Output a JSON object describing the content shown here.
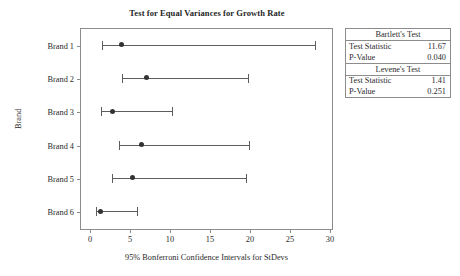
{
  "chart_data": {
    "type": "scatter",
    "title": "Test for Equal Variances for Growth Rate",
    "xlabel": "95% Bonferroni Confidence Intervals for StDevs",
    "ylabel": "Brand",
    "xlim": [
      0,
      30
    ],
    "xticks": [
      0,
      5,
      10,
      15,
      20,
      25,
      30
    ],
    "xticklabels": [
      "0",
      "5",
      "10",
      "15",
      "20",
      "25",
      "30"
    ],
    "categories": [
      "Brand 1",
      "Brand 2",
      "Brand 3",
      "Brand 4",
      "Brand 5",
      "Brand 6"
    ],
    "grid": false,
    "legend": false,
    "series": [
      {
        "name": "95% Bonferroni CI for StDev",
        "points": [
          {
            "category": "Brand 1",
            "center": 3.9,
            "lower": 1.5,
            "upper": 28.1
          },
          {
            "category": "Brand 2",
            "center": 7.0,
            "lower": 4.0,
            "upper": 19.8
          },
          {
            "category": "Brand 3",
            "center": 2.8,
            "lower": 1.4,
            "upper": 10.3
          },
          {
            "category": "Brand 4",
            "center": 6.4,
            "lower": 3.6,
            "upper": 19.9
          },
          {
            "category": "Brand 5",
            "center": 5.3,
            "lower": 2.8,
            "upper": 19.5
          },
          {
            "category": "Brand 6",
            "center": 1.3,
            "lower": 0.7,
            "upper": 5.9
          }
        ]
      }
    ],
    "annotations": {
      "tests": [
        {
          "heading": "Bartlett's Test",
          "rows": [
            {
              "label": "Test Statistic",
              "value": "11.67"
            },
            {
              "label": "P-Value",
              "value": "0.040"
            }
          ]
        },
        {
          "heading": "Levene's Test",
          "rows": [
            {
              "label": "Test Statistic",
              "value": "1.41"
            },
            {
              "label": "P-Value",
              "value": "0.251"
            }
          ]
        }
      ]
    },
    "colors": {
      "axis": "#8c8c8c",
      "interval": "#5d5d5d",
      "marker": "#333333",
      "text": "#2b2b2b",
      "background": "#ffffff"
    }
  }
}
